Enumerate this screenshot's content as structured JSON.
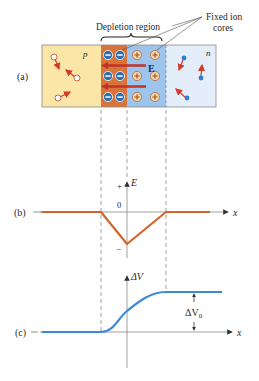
{
  "figure": {
    "panel_a": {
      "label": "(a)",
      "p_label": "p",
      "n_label": "n",
      "depletion_label": "Depletion region",
      "fixed_ion_label_line1": "Fixed ion",
      "fixed_ion_label_line2": "cores",
      "field_label": "E",
      "negative_ion_symbol": "−",
      "positive_ion_symbol": "+",
      "colors": {
        "p_region": "#fbe6a8",
        "depletion_negative": "#d8733a",
        "depletion_positive": "#9cc4ec",
        "n_region": "#e3eefa",
        "field_arrow": "#c0322a",
        "hole": "#ffffff",
        "electron": "#2f7fd0",
        "motion_arrow": "#d43a2a"
      }
    },
    "panel_b": {
      "label": "(b)",
      "y_axis_label": "E",
      "x_axis_label": "x",
      "plus_label": "+",
      "zero_label": "0",
      "minus_label": "−",
      "curve_color": "#d3642a"
    },
    "panel_c": {
      "label": "(c)",
      "y_axis_label": "ΔV",
      "x_axis_label": "x",
      "delta_label": "ΔV",
      "delta_sub": "0",
      "curve_color": "#3a8ad6"
    }
  }
}
